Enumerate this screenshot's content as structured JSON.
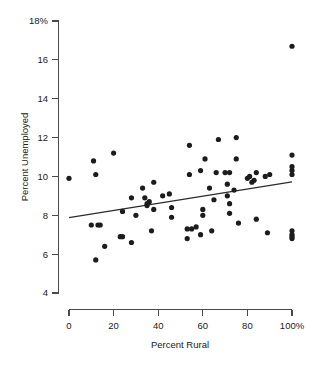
{
  "chart_data": {
    "type": "scatter",
    "title": "",
    "xlabel": "Percent Rural",
    "ylabel": "Percent Unemployed",
    "xlim": [
      0,
      100
    ],
    "ylim": [
      4,
      18
    ],
    "grid": false,
    "legend": null,
    "x_ticks": [
      0,
      20,
      40,
      60,
      80,
      100
    ],
    "x_tick_labels": [
      "0",
      "20",
      "40",
      "60",
      "80",
      "100%"
    ],
    "y_ticks": [
      4,
      6,
      8,
      10,
      12,
      14,
      16,
      18
    ],
    "y_tick_labels": [
      "4",
      "6",
      "8",
      "10",
      "12",
      "14",
      "16",
      "18%"
    ],
    "points": [
      {
        "x": 0,
        "y": 9.9
      },
      {
        "x": 11,
        "y": 10.8
      },
      {
        "x": 12,
        "y": 10.1
      },
      {
        "x": 20,
        "y": 11.2
      },
      {
        "x": 10,
        "y": 7.5
      },
      {
        "x": 13,
        "y": 7.5
      },
      {
        "x": 14,
        "y": 7.5
      },
      {
        "x": 12,
        "y": 5.7
      },
      {
        "x": 16,
        "y": 6.4
      },
      {
        "x": 23,
        "y": 6.9
      },
      {
        "x": 24,
        "y": 6.9
      },
      {
        "x": 24,
        "y": 8.2
      },
      {
        "x": 28,
        "y": 8.9
      },
      {
        "x": 28,
        "y": 6.6
      },
      {
        "x": 30,
        "y": 8.0
      },
      {
        "x": 33,
        "y": 9.4
      },
      {
        "x": 34,
        "y": 8.9
      },
      {
        "x": 35,
        "y": 8.5
      },
      {
        "x": 35,
        "y": 8.6
      },
      {
        "x": 36,
        "y": 8.7
      },
      {
        "x": 37,
        "y": 7.2
      },
      {
        "x": 38,
        "y": 9.7
      },
      {
        "x": 38,
        "y": 8.3
      },
      {
        "x": 42,
        "y": 9.0
      },
      {
        "x": 45,
        "y": 9.1
      },
      {
        "x": 46,
        "y": 8.4
      },
      {
        "x": 46,
        "y": 7.9
      },
      {
        "x": 53,
        "y": 7.3
      },
      {
        "x": 53,
        "y": 6.8
      },
      {
        "x": 54,
        "y": 11.6
      },
      {
        "x": 54,
        "y": 10.1
      },
      {
        "x": 55,
        "y": 7.3
      },
      {
        "x": 57,
        "y": 7.4
      },
      {
        "x": 59,
        "y": 7.0
      },
      {
        "x": 59,
        "y": 10.3
      },
      {
        "x": 60,
        "y": 8.3
      },
      {
        "x": 60,
        "y": 8.0
      },
      {
        "x": 61,
        "y": 10.9
      },
      {
        "x": 63,
        "y": 9.4
      },
      {
        "x": 64,
        "y": 7.2
      },
      {
        "x": 65,
        "y": 8.8
      },
      {
        "x": 66,
        "y": 10.2
      },
      {
        "x": 67,
        "y": 11.9
      },
      {
        "x": 70,
        "y": 10.2
      },
      {
        "x": 71,
        "y": 9.6
      },
      {
        "x": 71,
        "y": 9.0
      },
      {
        "x": 72,
        "y": 8.6
      },
      {
        "x": 72,
        "y": 8.1
      },
      {
        "x": 72,
        "y": 10.2
      },
      {
        "x": 74,
        "y": 9.3
      },
      {
        "x": 75,
        "y": 12.0
      },
      {
        "x": 75,
        "y": 10.9
      },
      {
        "x": 76,
        "y": 7.6
      },
      {
        "x": 80,
        "y": 9.9
      },
      {
        "x": 81,
        "y": 10.0
      },
      {
        "x": 82,
        "y": 9.7
      },
      {
        "x": 83,
        "y": 9.8
      },
      {
        "x": 84,
        "y": 10.2
      },
      {
        "x": 84,
        "y": 7.8
      },
      {
        "x": 88,
        "y": 10.0
      },
      {
        "x": 90,
        "y": 10.1
      },
      {
        "x": 89,
        "y": 7.1
      },
      {
        "x": 100,
        "y": 16.7
      },
      {
        "x": 100,
        "y": 11.1
      },
      {
        "x": 100,
        "y": 10.5
      },
      {
        "x": 100,
        "y": 10.3
      },
      {
        "x": 100,
        "y": 10.1
      },
      {
        "x": 100,
        "y": 7.2
      },
      {
        "x": 100,
        "y": 7.0
      },
      {
        "x": 100,
        "y": 6.9
      },
      {
        "x": 100,
        "y": 6.8
      }
    ],
    "fit_line": {
      "x0": 0,
      "y0": 7.88,
      "x1": 100,
      "y1": 9.72
    },
    "marker_radius_px": 2.6,
    "colors": {
      "point": "#1c1c1c",
      "line": "#2b2b2b",
      "axis": "#4a4a4a",
      "background": "#ffffff"
    }
  }
}
